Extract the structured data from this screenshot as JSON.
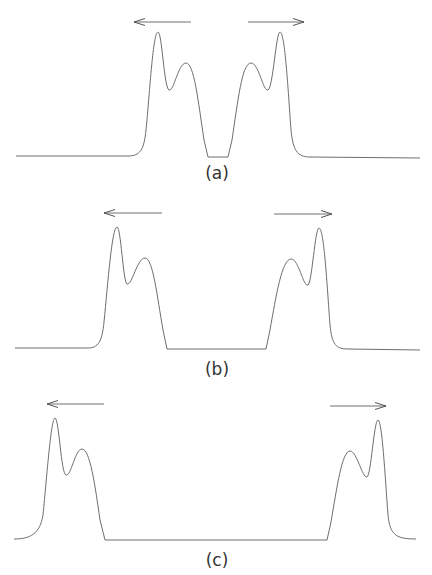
{
  "figure": {
    "colors": {
      "curve": "#6e6e6e",
      "arrow": "#707070",
      "label": "#333333",
      "background": "#ffffff"
    },
    "panels": [
      {
        "label": "(a)",
        "label_pos": [
          217,
          179
        ],
        "baseline_y": 157,
        "floor": {
          "x1": 208,
          "x2": 228,
          "y": 157
        },
        "left_arrow": {
          "x1": 191,
          "x2": 134,
          "y": 22,
          "direction": "left"
        },
        "right_arrow": {
          "x1": 248,
          "x2": 304,
          "y": 22,
          "direction": "right"
        },
        "left_pulse": {
          "main_peak": [
            158,
            32
          ],
          "dip": [
            169,
            90
          ],
          "secondary_peak": [
            186,
            63
          ]
        },
        "right_pulse": {
          "main_peak": [
            280,
            32
          ],
          "dip": [
            268,
            90
          ],
          "secondary_peak": [
            251,
            63
          ]
        }
      },
      {
        "label": "(b)",
        "label_pos": [
          217,
          375
        ],
        "baseline_y": 349,
        "floor": {
          "x1": 167,
          "x2": 266,
          "y": 349
        },
        "left_arrow": {
          "x1": 162,
          "x2": 104,
          "y": 213,
          "direction": "left"
        },
        "right_arrow": {
          "x1": 274,
          "x2": 332,
          "y": 214,
          "direction": "right"
        },
        "left_pulse": {
          "main_peak": [
            117,
            227
          ],
          "dip": [
            127,
            284
          ],
          "secondary_peak": [
            145,
            258
          ]
        },
        "right_pulse": {
          "main_peak": [
            319,
            228
          ],
          "dip": [
            308,
            285
          ],
          "secondary_peak": [
            291,
            259
          ]
        }
      },
      {
        "label": "(c)",
        "label_pos": [
          217,
          566
        ],
        "baseline_y": 540,
        "floor": {
          "x1": 105,
          "x2": 327,
          "y": 540
        },
        "left_arrow": {
          "x1": 104,
          "x2": 47,
          "y": 404,
          "direction": "left"
        },
        "right_arrow": {
          "x1": 330,
          "x2": 386,
          "y": 406,
          "direction": "right"
        },
        "left_pulse": {
          "main_peak": [
            55,
            418
          ],
          "dip": [
            66,
            475
          ],
          "secondary_peak": [
            82,
            449
          ]
        },
        "right_pulse": {
          "main_peak": [
            378,
            420
          ],
          "dip": [
            367,
            477
          ],
          "secondary_peak": [
            350,
            451
          ]
        }
      }
    ]
  }
}
